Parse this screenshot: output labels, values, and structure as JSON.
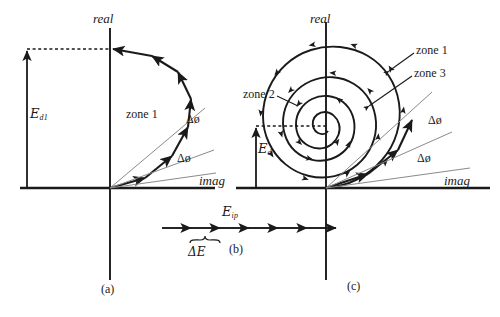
{
  "figure": {
    "width": 500,
    "height": 317,
    "background": "#ffffff",
    "ink": "#1a1a1a",
    "guide_color": "#8a8a8a",
    "type": "vector-diagram"
  },
  "panel_a": {
    "caption": "(a)",
    "axis_real_label": "real",
    "axis_imag_label": "imag",
    "zone_label": "zone 1",
    "field_label_symbol": "E",
    "field_label_sub": "d1",
    "phase_step_label_1": "Δø",
    "phase_step_label_2": "Δø",
    "origin": [
      110,
      188
    ],
    "arc_radius": 88,
    "arc_segments": 6
  },
  "panel_b": {
    "caption": "(b)",
    "amplitude_label_symbol": "E",
    "amplitude_label_sub": "ip",
    "step_label_symbol": "ΔE",
    "arrow_count": 6,
    "y": 228,
    "x_start": 162,
    "x_end": 332
  },
  "panel_c": {
    "caption": "(c)",
    "axis_real_label": "real",
    "axis_imag_label": "imag",
    "zone_label_1": "zone 1",
    "zone_label_2": "zone 2",
    "zone_label_3": "zone 3",
    "field_label_symbol": "E",
    "field_label_sub": "d",
    "phase_step_label_1": "Δø",
    "phase_step_label_2": "Δø",
    "origin": [
      326,
      188
    ],
    "spiral_turns": 2.75,
    "spiral_max_radius": 90
  }
}
